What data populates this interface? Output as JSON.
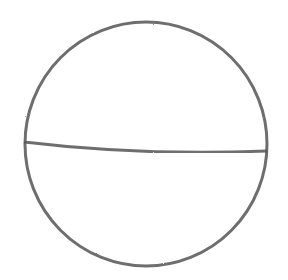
{
  "drawing": {
    "description": "pencil sketch of a circle with a horizontal chord",
    "stroke_color": "#555555",
    "background": "#ffffff",
    "circle": {
      "cx": 146,
      "cy": 144,
      "rx": 121,
      "ry": 122
    },
    "chord": {
      "x1": 24,
      "y1": 142,
      "x2": 267,
      "y2": 151
    }
  }
}
